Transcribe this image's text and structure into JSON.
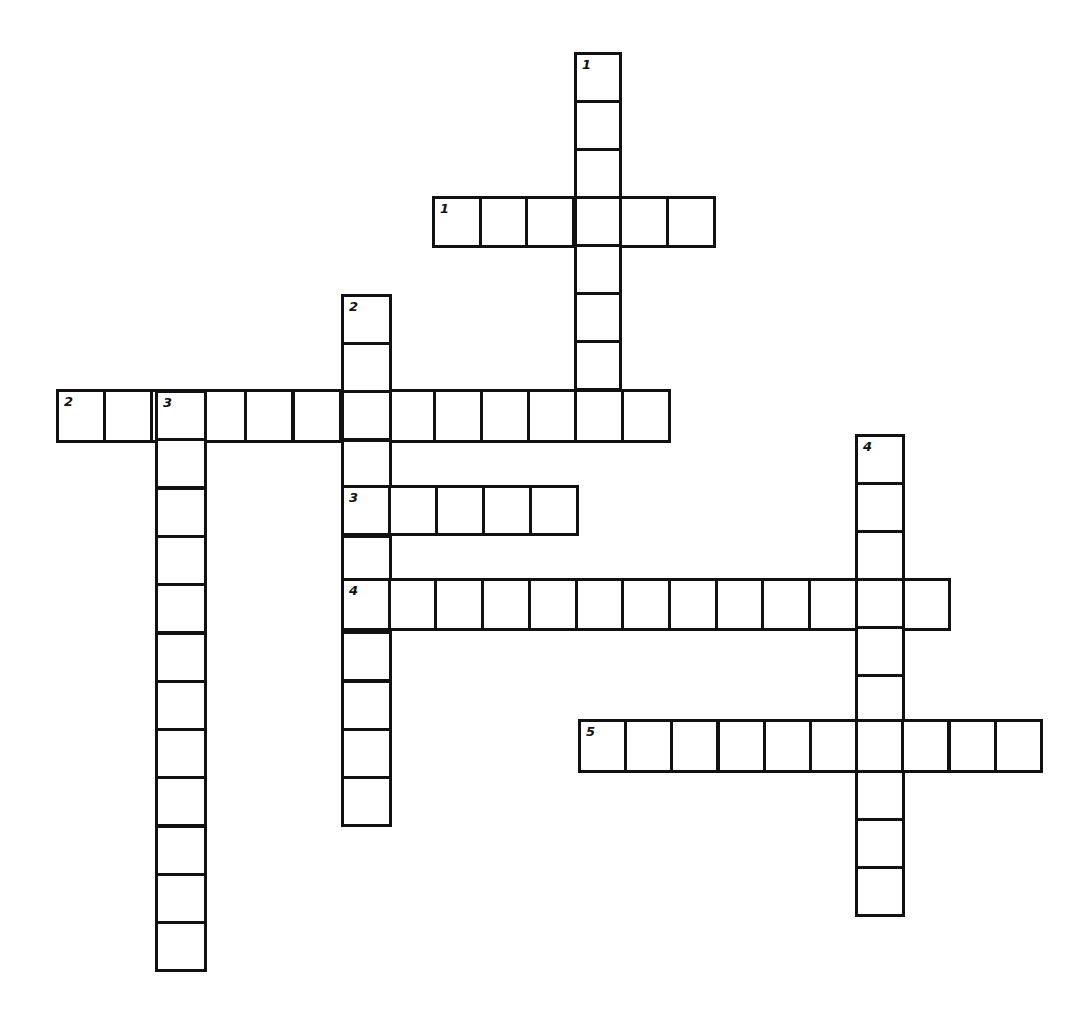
{
  "puzzle": {
    "type": "crossword",
    "background_color": "#ffffff",
    "line_color": "#111111"
  },
  "entries": [
    {
      "id": "across-1",
      "number": "1",
      "direction": "across",
      "length": 6,
      "x": 432,
      "y": 196,
      "cell_w": 46.7,
      "cell_h": 49
    },
    {
      "id": "down-1",
      "number": "1",
      "direction": "down",
      "length": 8,
      "x": 574,
      "y": 52,
      "cell_w": 45,
      "cell_h": 48
    },
    {
      "id": "across-2",
      "number": "2",
      "direction": "across",
      "length": 13,
      "x": 56,
      "y": 389,
      "cell_w": 47.1,
      "cell_h": 51
    },
    {
      "id": "down-2",
      "number": "2",
      "direction": "down",
      "length": 11,
      "x": 341,
      "y": 294,
      "cell_w": 48,
      "cell_h": 48.2
    },
    {
      "id": "down-3",
      "number": "3",
      "direction": "down",
      "length": 12,
      "x": 155,
      "y": 390,
      "cell_w": 49,
      "cell_h": 48.3
    },
    {
      "id": "across-3",
      "number": "3",
      "direction": "across",
      "length": 5,
      "x": 341,
      "y": 485,
      "cell_w": 47,
      "cell_h": 48
    },
    {
      "id": "across-4",
      "number": "4",
      "direction": "across",
      "length": 13,
      "x": 341,
      "y": 578,
      "cell_w": 46.7,
      "cell_h": 50
    },
    {
      "id": "down-4",
      "number": "4",
      "direction": "down",
      "length": 10,
      "x": 855,
      "y": 434,
      "cell_w": 47,
      "cell_h": 48
    },
    {
      "id": "across-5",
      "number": "5",
      "direction": "across",
      "length": 10,
      "x": 578,
      "y": 719,
      "cell_w": 46.2,
      "cell_h": 51
    }
  ]
}
